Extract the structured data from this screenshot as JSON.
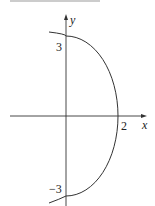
{
  "figure": {
    "type": "graph",
    "axes": {
      "x_label": "x",
      "y_label": "y"
    },
    "tick_labels": {
      "x_intercept": "2",
      "y_top": "3",
      "y_bottom": "−3"
    },
    "colors": {
      "curve": "#333333",
      "axis": "#333333",
      "top_rule": "#bbbbbb"
    }
  }
}
